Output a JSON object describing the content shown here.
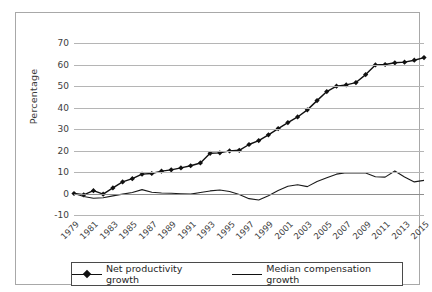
{
  "chart_data": {
    "type": "line",
    "title": "",
    "xlabel": "",
    "ylabel": "Percentage",
    "ylim": [
      -10,
      70
    ],
    "yticks": [
      -10,
      0,
      10,
      20,
      30,
      40,
      50,
      60,
      70
    ],
    "grid": true,
    "legend_position": "bottom",
    "x": [
      1979,
      1980,
      1981,
      1982,
      1983,
      1984,
      1985,
      1986,
      1987,
      1988,
      1989,
      1990,
      1991,
      1992,
      1993,
      1994,
      1995,
      1996,
      1997,
      1998,
      1999,
      2000,
      2001,
      2002,
      2003,
      2004,
      2005,
      2006,
      2007,
      2008,
      2009,
      2010,
      2011,
      2012,
      2013,
      2014,
      2015
    ],
    "xtick_labels": [
      "1979",
      "1981",
      "1983",
      "1985",
      "1987",
      "1989",
      "1991",
      "1993",
      "1995",
      "1997",
      "1999",
      "2001",
      "2003",
      "2005",
      "2007",
      "2009",
      "2011",
      "2013",
      "2015"
    ],
    "series": [
      {
        "name": "Net productivity growth",
        "marker": "diamond",
        "color": "#111111",
        "values": [
          0.0,
          -0.6,
          1.3,
          -0.3,
          2.6,
          5.4,
          6.9,
          9.0,
          9.3,
          10.4,
          11.0,
          11.9,
          12.9,
          14.2,
          18.7,
          18.9,
          19.8,
          20.1,
          22.8,
          24.6,
          27.3,
          30.2,
          33.0,
          35.6,
          38.9,
          43.2,
          47.4,
          49.9,
          50.5,
          51.6,
          55.3,
          59.8,
          60.0,
          60.8,
          61.1,
          62.0,
          63.2
        ]
      },
      {
        "name": "Median compensation growth",
        "marker": "none",
        "color": "#1a1a1a",
        "values": [
          0.0,
          -1.4,
          -2.2,
          -2.0,
          -1.1,
          -0.3,
          0.5,
          1.8,
          0.6,
          0.2,
          0.1,
          -0.1,
          -0.3,
          0.5,
          1.2,
          1.6,
          0.9,
          -0.5,
          -2.4,
          -3.0,
          -1.0,
          1.4,
          3.4,
          4.1,
          3.2,
          5.6,
          7.3,
          9.0,
          9.7,
          9.6,
          9.5,
          7.8,
          7.6,
          10.5,
          7.7,
          5.4,
          6.1
        ]
      }
    ]
  },
  "axis": {
    "y_label": "Percentage"
  },
  "legend": {
    "items": [
      {
        "label": "Net productivity growth"
      },
      {
        "label": "Median compensation growth"
      }
    ]
  }
}
